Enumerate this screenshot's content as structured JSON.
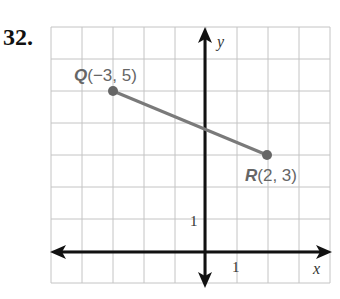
{
  "problem_number": "32.",
  "chart_data": {
    "type": "line",
    "title": "",
    "xlabel": "x",
    "ylabel": "y",
    "xlim": [
      -5,
      4
    ],
    "ylim": [
      -1,
      7
    ],
    "grid": true,
    "tick_labels": {
      "x": "1",
      "y": "1"
    },
    "points": [
      {
        "name": "Q",
        "x": -3,
        "y": 5,
        "label": "(−3, 5)"
      },
      {
        "name": "R",
        "x": 2,
        "y": 3,
        "label": "(2, 3)"
      }
    ],
    "segments": [
      {
        "from": "Q",
        "to": "R"
      }
    ]
  },
  "colors": {
    "segment": "#777777",
    "grid": "#bbbbbb",
    "axis": "#111111"
  }
}
